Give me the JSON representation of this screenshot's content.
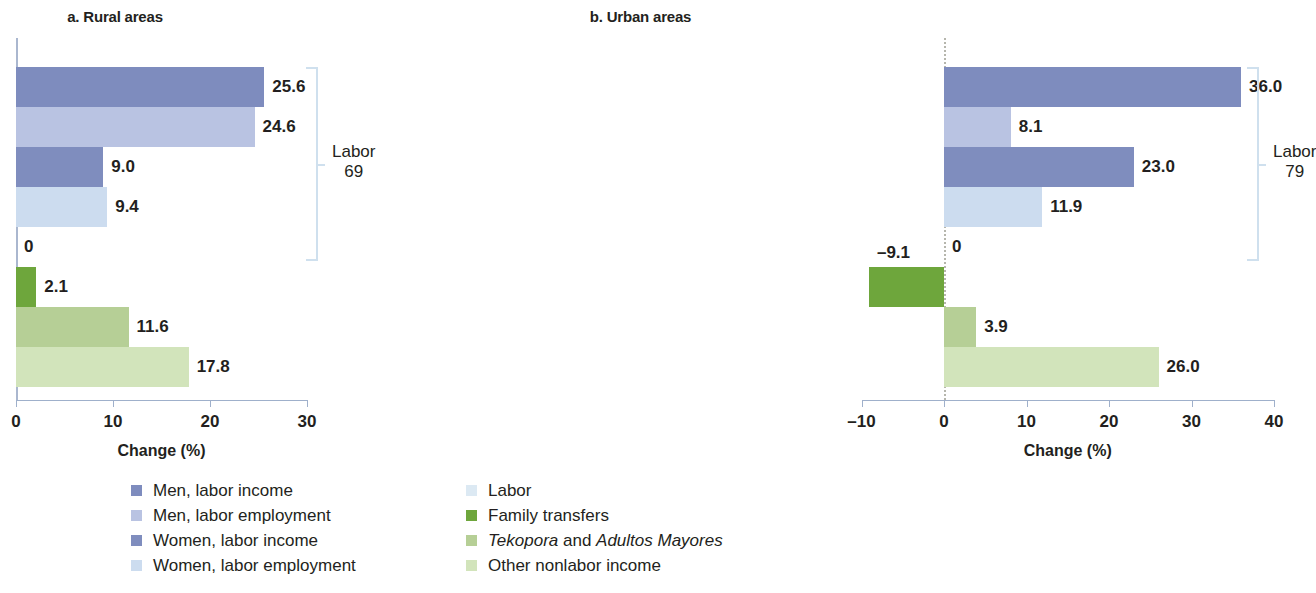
{
  "figure": {
    "xaxis_title": "Change (%)"
  },
  "colors": {
    "men_labor_income": "#7e8cbe",
    "men_labor_employment": "#b9c3e2",
    "women_labor_income": "#7f8dbe",
    "women_labor_employment": "#ccdcef",
    "labor": "#dce9f3",
    "family_transfers": "#6ea63c",
    "tekopora_adultos": "#b6cf96",
    "other_nonlabor_income": "#d2e4bb",
    "axis": "#9fb0cb",
    "bracket": "#cfe0ee",
    "zero_dash": "#b6b6ad",
    "text": "#231f20"
  },
  "legend": {
    "left": [
      {
        "label": "Men, labor income",
        "color_key": "men_labor_income",
        "italic_parts": []
      },
      {
        "label": "Men, labor employment",
        "color_key": "men_labor_employment",
        "italic_parts": []
      },
      {
        "label": "Women, labor income",
        "color_key": "women_labor_income",
        "italic_parts": []
      },
      {
        "label": "Women, labor employment",
        "color_key": "women_labor_employment",
        "italic_parts": []
      }
    ],
    "right": [
      {
        "label": "Labor",
        "color_key": "labor",
        "italic_parts": []
      },
      {
        "label": "Family transfers",
        "color_key": "family_transfers",
        "italic_parts": []
      },
      {
        "label": "Tekopora and Adultos Mayores",
        "color_key": "tekopora_adultos",
        "italic_parts": [
          "Tekopora",
          "Adultos Mayores"
        ],
        "html": "<i>Tekopora</i> and <i>Adultos Mayores</i>"
      },
      {
        "label": "Other nonlabor income",
        "color_key": "other_nonlabor_income",
        "italic_parts": []
      }
    ]
  },
  "chart_data": [
    {
      "type": "bar",
      "orientation": "horizontal",
      "panel_id": "a",
      "title": "a. Rural areas",
      "xlabel": "Change (%)",
      "ylabel": "",
      "xlim": [
        0,
        31
      ],
      "xticks": [
        0,
        10,
        20,
        30
      ],
      "xticklabels": [
        "0",
        "10",
        "20",
        "30"
      ],
      "grid": false,
      "legend_position": "bottom",
      "categories": [
        "Men, labor income",
        "Men, labor employment",
        "Women, labor income",
        "Women, labor employment",
        "Labor",
        "Family transfers",
        "Tekopora and Adultos Mayores",
        "Other nonlabor income"
      ],
      "values": [
        25.6,
        24.6,
        9.0,
        9.4,
        0,
        2.1,
        11.6,
        17.8
      ],
      "value_labels": [
        "25.6",
        "24.6",
        "9.0",
        "9.4",
        "0",
        "2.1",
        "11.6",
        "17.8"
      ],
      "color_keys": [
        "men_labor_income",
        "men_labor_employment",
        "women_labor_income",
        "women_labor_employment",
        "labor",
        "family_transfers",
        "tekopora_adultos",
        "other_nonlabor_income"
      ],
      "annotation": {
        "text_line1": "Labor",
        "text_line2": "69",
        "spans_categories": [
          0,
          4
        ]
      }
    },
    {
      "type": "bar",
      "orientation": "horizontal",
      "panel_id": "b",
      "title": "b. Urban areas",
      "xlabel": "Change (%)",
      "ylabel": "",
      "xlim": [
        -10,
        41
      ],
      "xticks": [
        -10,
        0,
        10,
        20,
        30,
        40
      ],
      "xticklabels": [
        "–10",
        "0",
        "10",
        "20",
        "30",
        "40"
      ],
      "grid": false,
      "legend_position": "bottom",
      "categories": [
        "Men, labor income",
        "Men, labor employment",
        "Women, labor income",
        "Women, labor employment",
        "Labor",
        "Family transfers",
        "Tekopora and Adultos Mayores",
        "Other nonlabor income"
      ],
      "values": [
        36.0,
        8.1,
        23.0,
        11.9,
        0,
        -9.1,
        3.9,
        26.0
      ],
      "value_labels": [
        "36.0",
        "8.1",
        "23.0",
        "11.9",
        "0",
        "–9.1",
        "3.9",
        "26.0"
      ],
      "color_keys": [
        "men_labor_income",
        "men_labor_employment",
        "women_labor_income",
        "women_labor_employment",
        "labor",
        "family_transfers",
        "tekopora_adultos",
        "other_nonlabor_income"
      ],
      "annotation": {
        "text_line1": "Labor",
        "text_line2": "79",
        "spans_categories": [
          0,
          4
        ]
      }
    }
  ]
}
